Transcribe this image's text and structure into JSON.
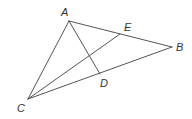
{
  "diagram": {
    "type": "geometry",
    "points": {
      "A": {
        "label": "A",
        "x": 69,
        "y": 21,
        "lx": 61,
        "ly": 16
      },
      "B": {
        "label": "B",
        "x": 172,
        "y": 47,
        "lx": 176,
        "ly": 51
      },
      "C": {
        "label": "C",
        "x": 28,
        "y": 99,
        "lx": 17,
        "ly": 112
      },
      "D": {
        "label": "D",
        "x": 100,
        "y": 74,
        "lx": 100,
        "ly": 87
      },
      "E": {
        "label": "E",
        "x": 120,
        "y": 34,
        "lx": 124,
        "ly": 31
      }
    },
    "segments": [
      {
        "id": "AB",
        "from": "A",
        "to": "B"
      },
      {
        "id": "BC",
        "from": "B",
        "to": "C"
      },
      {
        "id": "CA",
        "from": "C",
        "to": "A"
      },
      {
        "id": "AD",
        "from": "A",
        "to": "D"
      },
      {
        "id": "CE",
        "from": "C",
        "to": "E"
      }
    ]
  }
}
